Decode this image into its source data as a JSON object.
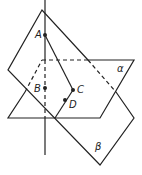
{
  "diagram": {
    "points": {
      "A": "A",
      "B": "B",
      "C": "C",
      "D": "D"
    },
    "planes": {
      "alpha": "α",
      "beta": "β"
    },
    "stroke_color": "#222222"
  }
}
